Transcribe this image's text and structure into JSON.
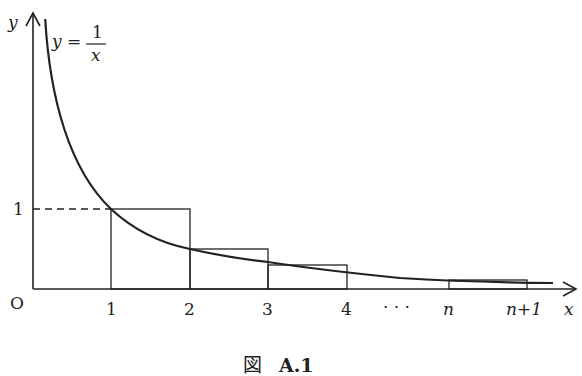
{
  "figure": {
    "caption_prefix": "図",
    "caption_label": "A.1",
    "function_label_lhs": "y =",
    "function_num": "1",
    "function_den": "x",
    "axis_y_label": "y",
    "axis_x_label": "x",
    "origin_label": "O",
    "y_tick_label": "1",
    "x_tick_labels": [
      "1",
      "2",
      "3",
      "4",
      "· · ·",
      "n",
      "n+1"
    ]
  },
  "colors": {
    "stroke": "#222222",
    "background": "#ffffff"
  }
}
